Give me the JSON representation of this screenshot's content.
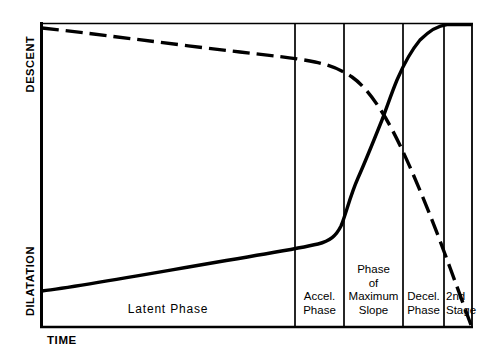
{
  "figure": {
    "title": "",
    "background": "#ffffff",
    "ink_color": "#000000"
  },
  "axes": {
    "y_upper_label": "DESCENT",
    "y_lower_label": "DILATATION",
    "x_label": "TIME"
  },
  "phases": [
    {
      "key": "latent",
      "label": "Latent Phase"
    },
    {
      "key": "accel",
      "label": "Accel.\nPhase"
    },
    {
      "key": "max_slope",
      "label": "Phase\nof\nMaximum\nSlope"
    },
    {
      "key": "decel",
      "label": "Decel.\nPhase"
    },
    {
      "key": "second_stage",
      "label": "2nd\nStage"
    }
  ],
  "chart_data": {
    "type": "line",
    "title": "",
    "xlabel": "TIME",
    "ylabel": "DILATATION / DESCENT",
    "grid": false,
    "legend": "none",
    "axis_ranges": {
      "x": [
        0,
        100
      ],
      "y": [
        0,
        100
      ]
    },
    "annotations": [
      "Latent Phase",
      "Accel. Phase",
      "Phase of Maximum Slope",
      "Decel. Phase",
      "2nd Stage"
    ],
    "phase_boundaries_x_percent": [
      58.7,
      70.1,
      83.8,
      93.3
    ],
    "series": [
      {
        "name": "Dilatation",
        "style": "solid",
        "description": "Sigmoid cervical dilatation curve: slow latent rise, acceleration, maximum slope, deceleration then plateau.",
        "x": [
          0,
          10,
          20,
          30,
          40,
          50,
          58.7,
          63,
          67,
          70.1,
          74,
          78,
          81,
          83.8,
          87,
          90,
          93.3,
          96,
          100
        ],
        "y": [
          12,
          15,
          18,
          21,
          23,
          25,
          27,
          29,
          33,
          41,
          56,
          70,
          80,
          86,
          92,
          96,
          99,
          100,
          100
        ]
      },
      {
        "name": "Descent",
        "style": "dashed",
        "description": "Fetal station descent curve: flat early, then steep linear descent through deceleration phase and second stage.",
        "x": [
          0,
          10,
          20,
          30,
          40,
          50,
          58.7,
          65,
          70.1,
          75,
          81.2,
          86,
          90,
          93.3,
          96,
          100
        ],
        "y": [
          98,
          95,
          92,
          90,
          88,
          86,
          85,
          83,
          80,
          75,
          67,
          50,
          36,
          26,
          15,
          2
        ]
      }
    ]
  }
}
